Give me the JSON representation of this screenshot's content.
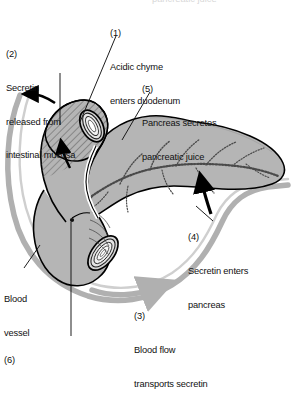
{
  "figure": {
    "title_cut_off_top": "pancreatic juice",
    "colors": {
      "organ_fill": "#b5b5b5",
      "organ_fill_light": "#c9c9c9",
      "duodenum_hatch": "#6e6e6e",
      "outline": "#000000",
      "blood_vessel": "#b0b0b0",
      "duct": "#4a4a4a",
      "text": "#111111",
      "background": "#ffffff"
    }
  },
  "labels": {
    "step1": {
      "number": "(1)",
      "line1": "Acidic chyme",
      "line2": "enters duodenum"
    },
    "step2": {
      "number": "(2)",
      "line1": "Secretin",
      "line2": "released from",
      "line3": "intestinal mucosa"
    },
    "step3": {
      "number": "(3)",
      "line1": "Blood flow",
      "line2": "transports secretin"
    },
    "step4": {
      "number": "(4)",
      "line1": "Secretin enters",
      "line2": "pancreas"
    },
    "step5": {
      "number": "(5)",
      "line1": "Pancreas secretes",
      "line2": "pancreatic juice"
    },
    "step6": {
      "number": "(6)"
    },
    "blood_vessel": {
      "line1": "Blood",
      "line2": "vessel"
    }
  },
  "structures": {
    "duodenum": "duodenum",
    "pancreas": "pancreas",
    "pancreatic_duct": "pancreatic-duct",
    "blood_vessel": "blood-vessel",
    "duodenum_cut_end": "duodenum-cut-end",
    "duodenal_papilla": "duodenal-papilla"
  }
}
